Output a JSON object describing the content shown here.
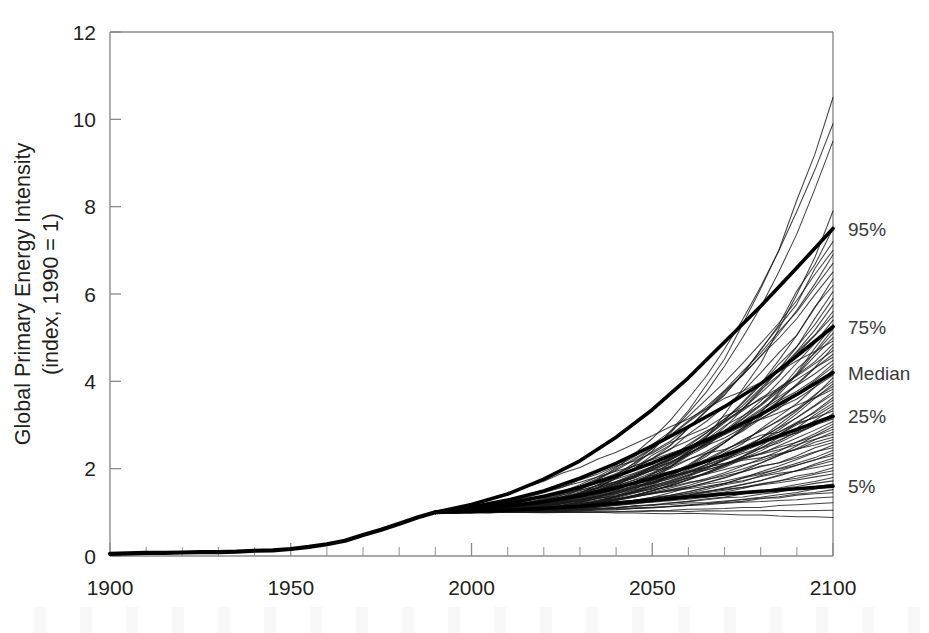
{
  "chart_data": {
    "type": "line",
    "title": "",
    "xlabel": "",
    "ylabel": "Global Primary Energy Intensity\n(index, 1990 = 1)",
    "ylabel_line1": "Global Primary Energy Intensity",
    "ylabel_line2": "(index, 1990 = 1)",
    "xlim": [
      1900,
      2100
    ],
    "ylim": [
      0,
      12
    ],
    "xticks": [
      1900,
      1950,
      2000,
      2050,
      2100
    ],
    "xtick_labels": [
      "1900",
      "1950",
      "2000",
      "2050",
      "2100"
    ],
    "x_minor_tick_step": 10,
    "yticks": [
      0,
      2,
      4,
      6,
      8,
      10,
      12
    ],
    "ytick_labels": [
      "0",
      "2",
      "4",
      "6",
      "8",
      "10",
      "12"
    ],
    "grid": false,
    "legend_position": "right-outside-endpoints",
    "annotations": [
      {
        "label": "95%",
        "value": 7.5,
        "x": 2100
      },
      {
        "label": "75%",
        "value": 5.25,
        "x": 2100
      },
      {
        "label": "Median",
        "value": 4.2,
        "x": 2100
      },
      {
        "label": "25%",
        "value": 3.2,
        "x": 2100
      },
      {
        "label": "5%",
        "value": 1.6,
        "x": 2100
      }
    ],
    "history": {
      "name": "Historical global primary energy intensity",
      "x": [
        1900,
        1905,
        1910,
        1915,
        1920,
        1925,
        1930,
        1935,
        1940,
        1945,
        1950,
        1955,
        1960,
        1965,
        1970,
        1975,
        1980,
        1985,
        1990
      ],
      "values": [
        0.05,
        0.06,
        0.07,
        0.07,
        0.08,
        0.09,
        0.09,
        0.1,
        0.12,
        0.13,
        0.16,
        0.21,
        0.27,
        0.35,
        0.48,
        0.6,
        0.74,
        0.88,
        1.0
      ]
    },
    "percentiles": {
      "x": [
        1990,
        2000,
        2010,
        2020,
        2030,
        2040,
        2050,
        2060,
        2070,
        2080,
        2090,
        2100
      ],
      "series": [
        {
          "name": "95%",
          "values": [
            1.0,
            1.18,
            1.42,
            1.76,
            2.18,
            2.72,
            3.35,
            4.08,
            4.9,
            5.72,
            6.6,
            7.5
          ]
        },
        {
          "name": "75%",
          "values": [
            1.0,
            1.12,
            1.28,
            1.49,
            1.78,
            2.12,
            2.52,
            2.96,
            3.42,
            3.94,
            4.58,
            5.25
          ]
        },
        {
          "name": "Median",
          "values": [
            1.0,
            1.09,
            1.21,
            1.37,
            1.57,
            1.83,
            2.13,
            2.47,
            2.84,
            3.24,
            3.7,
            4.2
          ]
        },
        {
          "name": "25%",
          "values": [
            1.0,
            1.06,
            1.14,
            1.24,
            1.38,
            1.56,
            1.78,
            2.03,
            2.31,
            2.6,
            2.9,
            3.2
          ]
        },
        {
          "name": "5%",
          "values": [
            1.0,
            1.02,
            1.05,
            1.09,
            1.14,
            1.21,
            1.28,
            1.35,
            1.42,
            1.48,
            1.54,
            1.6
          ]
        }
      ]
    },
    "scenario_count": 80,
    "scenario_note": "Individual IPCC SRES-style scenario trajectories, 1990-2100, each indexed to 1 in 1990",
    "scenario_endpoints_2100": [
      10.5,
      9.9,
      9.5,
      7.9,
      7.5,
      7.2,
      7.0,
      6.9,
      6.7,
      6.5,
      6.35,
      6.2,
      6.05,
      5.9,
      5.75,
      5.6,
      5.5,
      5.4,
      5.3,
      5.2,
      5.1,
      5.0,
      4.92,
      4.85,
      4.78,
      4.7,
      4.62,
      4.55,
      4.48,
      4.4,
      4.33,
      4.27,
      4.2,
      4.14,
      4.08,
      4.0,
      3.94,
      3.88,
      3.82,
      3.76,
      3.7,
      3.63,
      3.57,
      3.5,
      3.44,
      3.38,
      3.32,
      3.26,
      3.2,
      3.14,
      3.08,
      3.02,
      2.96,
      2.9,
      2.84,
      2.78,
      2.72,
      2.66,
      2.6,
      2.54,
      2.48,
      2.42,
      2.36,
      2.3,
      2.24,
      2.18,
      2.1,
      2.02,
      1.95,
      1.88,
      1.8,
      1.72,
      1.65,
      1.6,
      1.52,
      1.45,
      1.35,
      1.22,
      1.05,
      0.88
    ]
  },
  "axis": {
    "y_title_line1": "Global Primary Energy Intensity",
    "y_title_line2": "(index, 1990 = 1)"
  },
  "colors": {
    "scenario_line": "#1a1a1a",
    "percentile_line": "#000000",
    "history_line": "#000000",
    "axis": "#8b8b8b",
    "text": "#231f20",
    "label_text": "#3a3a3a",
    "background": "#ffffff"
  }
}
